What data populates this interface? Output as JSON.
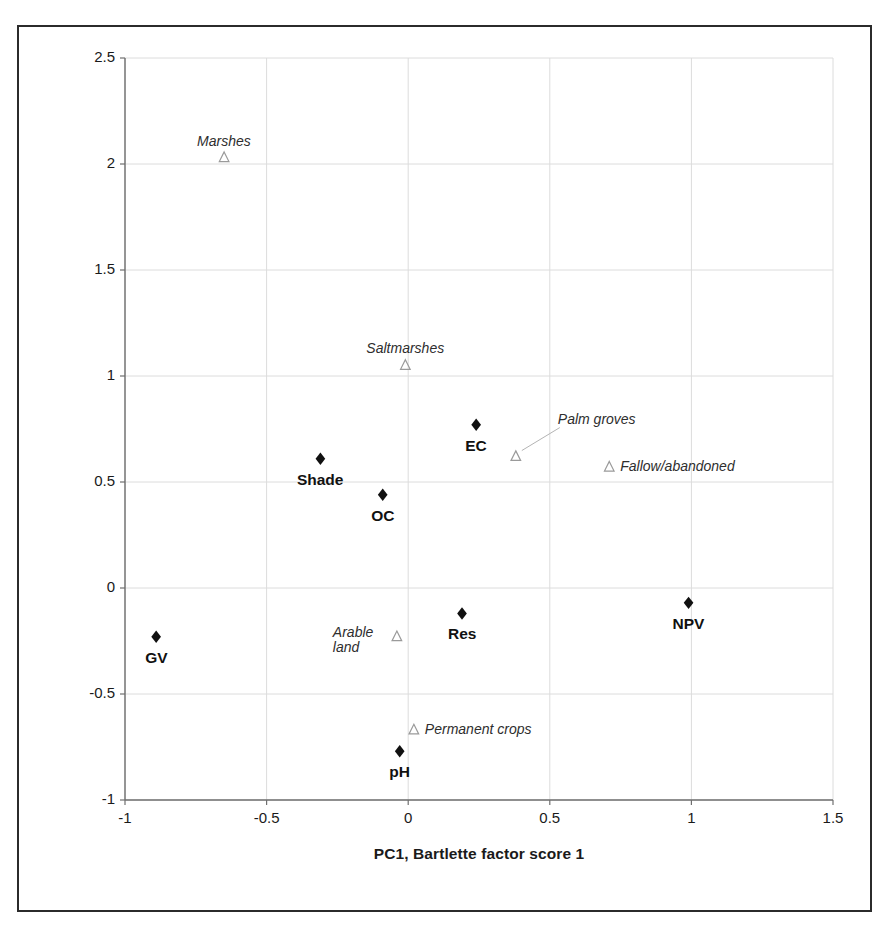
{
  "chart_data": {
    "type": "scatter",
    "title": "",
    "xlabel": "PC1, Bartlette factor score 1",
    "ylabel": "PC2, Bartlette factor score 2",
    "xlim": [
      -1,
      1.5
    ],
    "ylim": [
      -1,
      2.5
    ],
    "xticks": [
      "-1",
      "-0.5",
      "0",
      "0.5",
      "1",
      "1.5"
    ],
    "xtick_values": [
      -1,
      -0.5,
      0,
      0.5,
      1,
      1.5
    ],
    "yticks": [
      "2.5",
      "2",
      "1.5",
      "1",
      "0.5",
      "0",
      "-0.5",
      "-1"
    ],
    "ytick_values": [
      2.5,
      2,
      1.5,
      1,
      0.5,
      0,
      -0.5,
      -1
    ],
    "grid": true,
    "legend": "none",
    "series": [
      {
        "name": "Soil and vegetation variables",
        "marker": "filled-diamond",
        "marker_color": "#111111",
        "label_style": "bold",
        "points": [
          {
            "label": "GV",
            "x": -0.89,
            "y": -0.23,
            "label_dx": 0,
            "label_dy": 16
          },
          {
            "label": "Shade",
            "x": -0.31,
            "y": 0.61,
            "label_dx": 0,
            "label_dy": 16
          },
          {
            "label": "OC",
            "x": -0.09,
            "y": 0.44,
            "label_dx": 0,
            "label_dy": 16
          },
          {
            "label": "EC",
            "x": 0.24,
            "y": 0.77,
            "label_dx": 0,
            "label_dy": 16
          },
          {
            "label": "Res",
            "x": 0.19,
            "y": -0.12,
            "label_dx": 0,
            "label_dy": 16
          },
          {
            "label": "NPV",
            "x": 0.99,
            "y": -0.07,
            "label_dx": 0,
            "label_dy": 16
          },
          {
            "label": "pH",
            "x": -0.03,
            "y": -0.77,
            "label_dx": 0,
            "label_dy": 16
          }
        ]
      },
      {
        "name": "Land cover classes",
        "marker": "open-triangle",
        "marker_color": "#9a9a9a",
        "label_style": "italic",
        "points": [
          {
            "label": "Marshes",
            "x": -0.65,
            "y": 2.03,
            "label_pos": "above",
            "leader": false
          },
          {
            "label": "Saltmarshes",
            "x": -0.01,
            "y": 1.05,
            "label_pos": "above",
            "leader": false
          },
          {
            "label": "Palm groves",
            "x": 0.38,
            "y": 0.62,
            "label_pos": "upper-right",
            "leader": true
          },
          {
            "label": "Fallow/abandoned",
            "x": 0.71,
            "y": 0.57,
            "label_pos": "right",
            "leader": false
          },
          {
            "label": "Arable land",
            "x": -0.04,
            "y": -0.23,
            "label_pos": "left",
            "leader": false
          },
          {
            "label": "Permanent crops",
            "x": 0.02,
            "y": -0.67,
            "label_pos": "right",
            "leader": false
          }
        ]
      }
    ]
  },
  "axes": {
    "x_title": "PC1, Bartlette factor score 1",
    "y_title": "PC2, Bartlette factor score 2"
  },
  "ticks": {
    "y": [
      "2.5",
      "2",
      "1.5",
      "1",
      "0.5",
      "0",
      "-0.5",
      "-1"
    ],
    "x": [
      "-1",
      "-0.5",
      "0",
      "0.5",
      "1",
      "1.5"
    ]
  },
  "labels": {
    "gv": "GV",
    "shade": "Shade",
    "oc": "OC",
    "ec": "EC",
    "res": "Res",
    "npv": "NPV",
    "ph": "pH",
    "marshes": "Marshes",
    "saltmarshes": "Saltmarshes",
    "palm_groves": "Palm groves",
    "fallow_abandoned": "Fallow/abandoned",
    "arable_land": "Arable land",
    "permanent_crops": "Permanent crops"
  },
  "colors": {
    "frame": "#2b2b2b",
    "axis": "#6f6f6f",
    "grid": "#dcdcdc",
    "diamond": "#111111",
    "triangle": "#9a9a9a",
    "text": "#1a1a1a"
  }
}
